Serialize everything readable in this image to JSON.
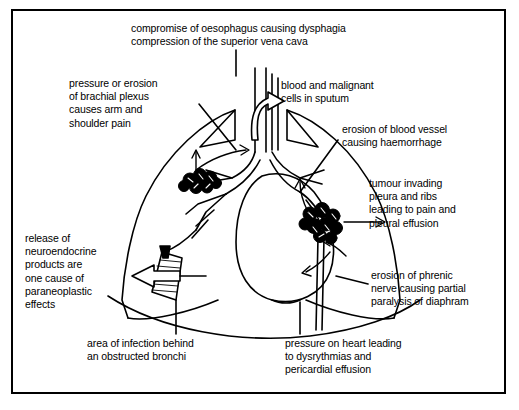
{
  "diagram": {
    "frame": {
      "border_color": "#000000",
      "background": "#ffffff"
    },
    "labels": {
      "oesophagus": "compromise of oesophagus causing dysphagia\ncompression of the superior vena cava",
      "brachial_plexus": "pressure or erosion\nof brachial plexus\ncauses arm and\nshoulder pain",
      "sputum": "blood and malignant\ncells in sputum",
      "erosion_blood_vessel": "erosion of blood vessel\ncausing haemorrhage",
      "tumour_pleura": "tumour invading\npleura and ribs\nleading to pain and\npleural effusion",
      "neuroendocrine": "release of\nneuroendocrine\nproducts are\none cause of\nparaneoplastic\neffects",
      "phrenic_nerve": "erosion of phrenic\nnerve causing partial\nparalysis of diaphram",
      "infection": "area of infection behind\nan obstructed bronchi",
      "heart_pressure": "pressure on heart leading\nto dysrythmias and\npericardial effusion"
    },
    "anatomy": {
      "left_lung": "left-lung-outline",
      "right_lung": "right-lung-outline",
      "trachea": "trachea",
      "bronchi": "bronchial-tree",
      "heart": "heart-outline",
      "diaphragm": "diaphragm-curve",
      "tumour_left": "tumour-mass-left",
      "tumour_right": "tumour-mass-right",
      "infection_area": "hatched-infection-wedge"
    },
    "colors": {
      "ink": "#000000",
      "paper": "#ffffff"
    }
  }
}
